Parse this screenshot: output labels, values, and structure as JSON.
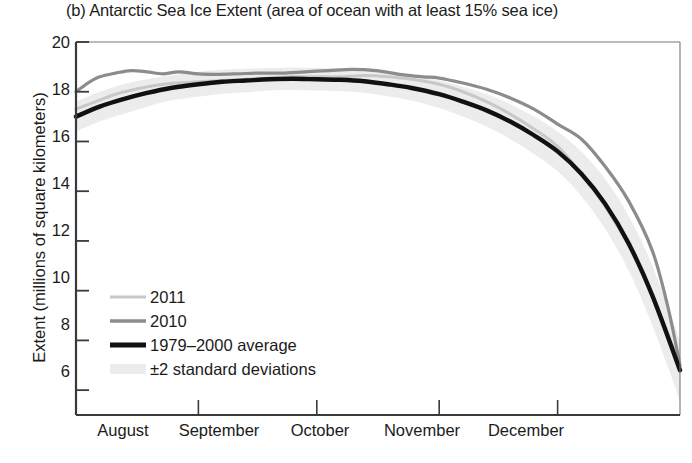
{
  "chart_data": {
    "type": "line",
    "title": "(b) Antarctic Sea Ice Extent (area of ocean with at least 15% sea ice)",
    "xlabel": "",
    "ylabel": "Extent (millions of square kilometers)",
    "ylim": [
      5,
      20
    ],
    "yticks": [
      20,
      18,
      16,
      14,
      12,
      10,
      8,
      6
    ],
    "xlim": [
      0,
      153
    ],
    "xtick_labels": [
      "August",
      "September",
      "October",
      "November",
      "December"
    ],
    "xtick_positions_days": [
      15.5,
      46,
      76.5,
      107,
      137.5
    ],
    "xtick_boundaries_days": [
      31,
      61,
      92,
      122
    ],
    "grid": false,
    "legend_position": "lower-left-inside",
    "x_unit": "day of period starting Aug 1",
    "series": [
      {
        "name": "2011",
        "color": "#c8c8c8",
        "width": 3.0,
        "x": [
          0,
          5,
          10,
          15,
          20,
          25,
          31,
          37,
          43,
          49,
          55,
          61,
          67,
          73,
          79,
          85,
          92,
          98,
          104,
          110,
          116,
          122,
          128,
          134,
          140,
          146,
          153
        ],
        "values": [
          17.3,
          17.6,
          17.9,
          18.1,
          18.25,
          18.35,
          18.4,
          18.45,
          18.5,
          18.55,
          18.6,
          18.6,
          18.6,
          18.65,
          18.6,
          18.5,
          18.3,
          18.0,
          17.6,
          17.1,
          16.5,
          15.8,
          14.7,
          13.4,
          11.8,
          9.8,
          7.0
        ]
      },
      {
        "name": "2010",
        "color": "#8c8c8c",
        "width": 3.2,
        "x": [
          0,
          3,
          6,
          10,
          14,
          18,
          22,
          26,
          31,
          36,
          41,
          46,
          52,
          58,
          64,
          70,
          76,
          82,
          88,
          92,
          98,
          104,
          110,
          116,
          122,
          128,
          134,
          140,
          146,
          150,
          153
        ],
        "values": [
          18.0,
          18.35,
          18.6,
          18.75,
          18.85,
          18.8,
          18.72,
          18.8,
          18.72,
          18.7,
          18.72,
          18.75,
          18.75,
          18.8,
          18.85,
          18.9,
          18.85,
          18.7,
          18.6,
          18.55,
          18.35,
          18.1,
          17.75,
          17.3,
          16.7,
          16.1,
          15.0,
          13.6,
          11.6,
          9.3,
          7.0
        ]
      },
      {
        "name": "1979–2000 average",
        "color": "#111111",
        "width": 4.4,
        "x": [
          0,
          6,
          12,
          18,
          24,
          31,
          37,
          43,
          49,
          55,
          61,
          67,
          73,
          79,
          85,
          92,
          98,
          104,
          110,
          116,
          122,
          128,
          134,
          140,
          146,
          153
        ],
        "values": [
          17.0,
          17.4,
          17.7,
          17.95,
          18.15,
          18.3,
          18.4,
          18.45,
          18.5,
          18.52,
          18.5,
          18.48,
          18.42,
          18.3,
          18.15,
          17.9,
          17.6,
          17.25,
          16.8,
          16.25,
          15.6,
          14.7,
          13.5,
          11.9,
          9.8,
          6.8
        ]
      }
    ],
    "band": {
      "name": "±2 standard deviations",
      "color": "#ececec",
      "x": [
        0,
        6,
        12,
        18,
        24,
        31,
        37,
        43,
        49,
        55,
        61,
        67,
        73,
        79,
        85,
        92,
        98,
        104,
        110,
        116,
        122,
        128,
        134,
        140,
        146,
        153
      ],
      "upper": [
        17.6,
        18.0,
        18.3,
        18.5,
        18.65,
        18.8,
        18.88,
        18.92,
        18.95,
        18.97,
        18.95,
        18.93,
        18.88,
        18.78,
        18.65,
        18.45,
        18.2,
        17.9,
        17.5,
        17.0,
        16.4,
        15.6,
        14.5,
        13.0,
        11.0,
        8.0
      ],
      "lower": [
        16.4,
        16.8,
        17.1,
        17.4,
        17.65,
        17.8,
        17.92,
        17.98,
        18.05,
        18.07,
        18.05,
        18.03,
        17.96,
        17.82,
        17.65,
        17.35,
        17.0,
        16.6,
        16.1,
        15.5,
        14.8,
        13.8,
        12.5,
        10.8,
        8.6,
        5.6
      ]
    },
    "legend_entries": [
      {
        "label": "2011",
        "type": "line",
        "color": "#c8c8c8",
        "width": 3.0
      },
      {
        "label": "2010",
        "type": "line",
        "color": "#8c8c8c",
        "width": 3.6
      },
      {
        "label": "1979–2000 average",
        "type": "line",
        "color": "#111111",
        "width": 5.0
      },
      {
        "label": "±2 standard deviations",
        "type": "band",
        "color": "#ececec",
        "width": 9
      }
    ]
  },
  "axes": {
    "ytick_labels": [
      "20",
      "18",
      "16",
      "14",
      "12",
      "10",
      "8",
      "6"
    ],
    "axis_color": "#3a3a3a"
  }
}
